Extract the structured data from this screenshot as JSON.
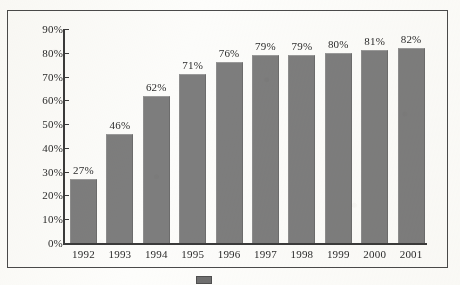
{
  "chart_data": {
    "type": "bar",
    "title": "",
    "subtitle": "",
    "xlabel": "",
    "ylabel": "",
    "categories": [
      "1992",
      "1993",
      "1994",
      "1995",
      "1996",
      "1997",
      "1998",
      "1999",
      "2000",
      "2001"
    ],
    "values": [
      27,
      46,
      62,
      71,
      76,
      79,
      79,
      80,
      81,
      82
    ],
    "value_labels": [
      "27%",
      "46%",
      "62%",
      "71%",
      "76%",
      "79%",
      "79%",
      "80%",
      "81%",
      "82%"
    ],
    "ylim": [
      0,
      90
    ],
    "ytick_labels": [
      "90%",
      "80%",
      "70%",
      "60%",
      "50%",
      "40%",
      "30%",
      "20%",
      "10%",
      "0%"
    ],
    "ytick_values": [
      90,
      80,
      70,
      60,
      50,
      40,
      30,
      20,
      10,
      0
    ],
    "grid": false,
    "legend_position": "bottom",
    "legend": [
      {
        "label": "",
        "color": "#7d7d7d"
      }
    ],
    "series": [
      {
        "name": "",
        "values": [
          27,
          46,
          62,
          71,
          76,
          79,
          79,
          80,
          81,
          82
        ],
        "color": "#7d7d7d"
      }
    ],
    "colors": {
      "bar": "#7d7d7d",
      "axis": "#3a3a3a",
      "frame": "#4a4a4a",
      "text": "#2b2b2b",
      "background": "#fcfcfa"
    }
  }
}
